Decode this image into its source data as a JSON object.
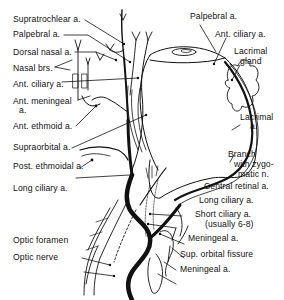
{
  "diagram": {
    "labels_left": [
      {
        "id": "supratrochlear",
        "text": "Supratrochlear a."
      },
      {
        "id": "palpebral_left",
        "text": "Palpebral a."
      },
      {
        "id": "dorsal_nasal",
        "text": "Dorsal nasal a."
      },
      {
        "id": "nasal_brs",
        "text": "Nasal brs."
      },
      {
        "id": "ant_ciliary_left",
        "text": "Ant. ciliary a."
      },
      {
        "id": "ant_meningeal_1",
        "text": "Ant. meningeal"
      },
      {
        "id": "ant_meningeal_2",
        "text": "a."
      },
      {
        "id": "ant_ethmoid",
        "text": "Ant. ethmoid a."
      },
      {
        "id": "supraorbital",
        "text": "Supraorbital a."
      },
      {
        "id": "post_ethmoidal",
        "text": "Post. ethmoidal a."
      },
      {
        "id": "long_ciliary_left",
        "text": "Long ciliary a."
      },
      {
        "id": "optic_foramen",
        "text": "Optic foramen"
      },
      {
        "id": "optic_nerve",
        "text": "Optic nerve"
      }
    ],
    "labels_right": [
      {
        "id": "palpebral_right",
        "text": "Palpebral a."
      },
      {
        "id": "ant_ciliary_right",
        "text": "Ant. ciliary a."
      },
      {
        "id": "lacrimal_gland_1",
        "text": "Lacrimal"
      },
      {
        "id": "lacrimal_gland_2",
        "text": "gland"
      },
      {
        "id": "lacrimal_a_1",
        "text": "Lacrimal"
      },
      {
        "id": "lacrimal_a_2",
        "text": "a."
      },
      {
        "id": "branch_1",
        "text": "Branch"
      },
      {
        "id": "branch_2",
        "text": "with zygo-"
      },
      {
        "id": "branch_3",
        "text": "matic n."
      },
      {
        "id": "central_retinal",
        "text": "Central retinal a."
      },
      {
        "id": "long_ciliary_right",
        "text": "Long ciliary a."
      },
      {
        "id": "short_ciliary_1",
        "text": "Short ciliary a."
      },
      {
        "id": "short_ciliary_2",
        "text": "(usually 6-8)"
      },
      {
        "id": "meningeal_1",
        "text": "Meningeal  a."
      },
      {
        "id": "sup_orbital_fissure",
        "text": "Sup. orbital fissure"
      },
      {
        "id": "meningeal_2",
        "text": "Meningeal a."
      }
    ],
    "colors": {
      "line": "#111111",
      "background": "#ffffff"
    }
  }
}
